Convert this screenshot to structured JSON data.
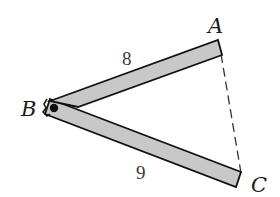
{
  "figure": {
    "vertices": {
      "A": {
        "label": "A"
      },
      "B": {
        "label": "B"
      },
      "C": {
        "label": "C"
      }
    },
    "bars": [
      {
        "id": "BA",
        "from": "B",
        "to": "A",
        "length_label": "8"
      },
      {
        "id": "BC",
        "from": "B",
        "to": "C",
        "length_label": "9"
      }
    ],
    "dashed_segment": {
      "from": "A",
      "to": "C",
      "length_label": ""
    },
    "colors": {
      "bar_fill": "#c8c8c8",
      "bar_stroke": "#111111",
      "background": "#ffffff",
      "dash": "#333333"
    }
  }
}
